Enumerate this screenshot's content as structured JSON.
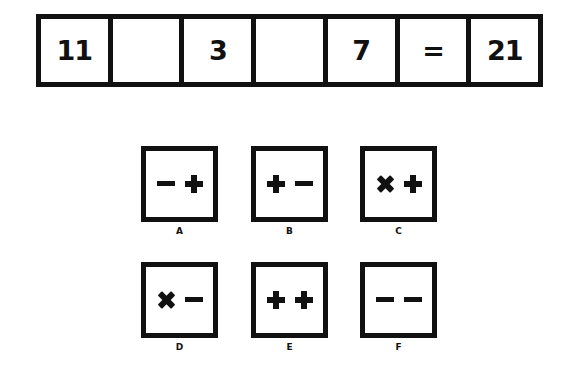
{
  "equation": {
    "cells": [
      "11",
      "",
      "3",
      "",
      "7",
      "=",
      "21"
    ]
  },
  "options": [
    {
      "label": "A",
      "symbols": [
        "minus",
        "plus"
      ]
    },
    {
      "label": "B",
      "symbols": [
        "plus",
        "minus"
      ]
    },
    {
      "label": "C",
      "symbols": [
        "times",
        "plus"
      ]
    },
    {
      "label": "D",
      "symbols": [
        "times",
        "minus"
      ]
    },
    {
      "label": "E",
      "symbols": [
        "plus",
        "plus"
      ]
    },
    {
      "label": "F",
      "symbols": [
        "minus",
        "minus"
      ]
    }
  ],
  "colors": {
    "ink": "#111111",
    "background": "#ffffff"
  }
}
